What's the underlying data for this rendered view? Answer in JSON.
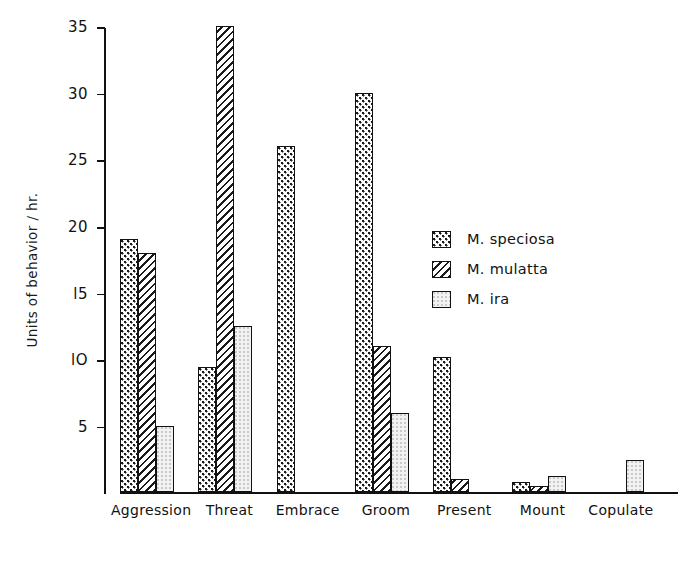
{
  "chart_data": {
    "type": "bar",
    "title": "",
    "xlabel": "",
    "ylabel": "Units  of  behavior / hr.",
    "ylim": [
      0,
      35
    ],
    "yticks": [
      5,
      10,
      15,
      20,
      25,
      30,
      35
    ],
    "ytick_labels": [
      "5",
      "lO",
      "l5",
      "20",
      "25",
      "30",
      "35"
    ],
    "grid": false,
    "legend_position": "right-center",
    "categories": [
      "Aggression",
      "Threat",
      "Embrace",
      "Groom",
      "Present",
      "Mount",
      "Copulate"
    ],
    "series": [
      {
        "name": "M. speciosa",
        "pattern": "checkered-dots",
        "values": [
          19,
          9.4,
          26,
          30,
          10.2,
          0.8,
          0
        ]
      },
      {
        "name": "M. mulatta",
        "pattern": "diagonal-hatch",
        "values": [
          18,
          35,
          0,
          11,
          1,
          0.5,
          0
        ]
      },
      {
        "name": "M. ira",
        "pattern": "light-stipple",
        "values": [
          5,
          12.5,
          0,
          6,
          0,
          1.2,
          2.4
        ]
      }
    ]
  },
  "legend": {
    "items": [
      {
        "label": "M. speciosa",
        "pattern": "checkered-dots"
      },
      {
        "label": "M. mulatta",
        "pattern": "diagonal-hatch"
      },
      {
        "label": "M. ira",
        "pattern": "light-stipple"
      }
    ]
  },
  "colors": {
    "ink": "#111111",
    "paper": "#ffffff",
    "light_fill": "#f2f2f2"
  }
}
